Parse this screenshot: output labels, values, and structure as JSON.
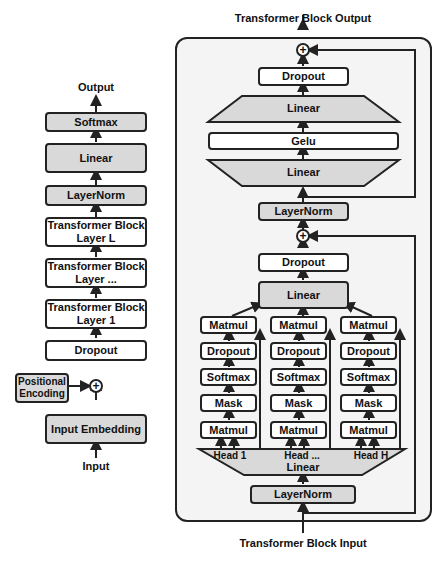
{
  "left_stack": {
    "output_label": "Output",
    "softmax": "Softmax",
    "linear": "Linear",
    "layernorm": "LayerNorm",
    "block_l": "Transformer Block Layer L",
    "block_dots": "Transformer Block Layer ...",
    "block_1": "Transformer Block Layer 1",
    "dropout": "Dropout",
    "positional_encoding": "Positional Encoding",
    "plus": "+",
    "input_embedding": "Input Embedding",
    "input_label": "Input"
  },
  "block": {
    "output_label": "Transformer Block Output",
    "input_label": "Transformer Block Input",
    "plus": "+",
    "mlp": {
      "dropout": "Dropout",
      "linear_top": "Linear",
      "gelu": "Gelu",
      "linear_bottom": "Linear",
      "layernorm": "LayerNorm"
    },
    "attention": {
      "dropout": "Dropout",
      "linear": "Linear",
      "heads": [
        {
          "name": "Head 1",
          "matmul_top": "Matmul",
          "dropout": "Dropout",
          "softmax": "Softmax",
          "mask": "Mask",
          "matmul_bottom": "Matmul"
        },
        {
          "name": "Head ...",
          "matmul_top": "Matmul",
          "dropout": "Dropout",
          "softmax": "Softmax",
          "mask": "Mask",
          "matmul_bottom": "Matmul"
        },
        {
          "name": "Head H",
          "matmul_top": "Matmul",
          "dropout": "Dropout",
          "softmax": "Softmax",
          "mask": "Mask",
          "matmul_bottom": "Matmul"
        }
      ],
      "qkv_linear": "Linear",
      "layernorm": "LayerNorm"
    }
  },
  "colors": {
    "gray_fill": "#d9d9d9",
    "container_fill": "#f4f4f4",
    "stroke": "#222222"
  }
}
